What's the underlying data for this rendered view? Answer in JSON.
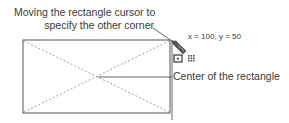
{
  "diagram": {
    "callouts": {
      "cursor_line1": "Moving the rectangle cursor to",
      "cursor_line2": "specify the other corner",
      "coordinates": "x = 100, y = 50",
      "center": "Center of the rectangle"
    },
    "shapes": {
      "rectangle": {
        "x": 23,
        "y": 40,
        "width": 147,
        "height": 73,
        "stroke": "#555555"
      },
      "diagonals": {
        "style": "dashed",
        "stroke": "#888888"
      },
      "center_point": {
        "x": 96,
        "y": 77
      }
    },
    "icons": [
      "pencil-cursor-icon",
      "rectangle-mode-icon",
      "grid-snap-icon"
    ]
  }
}
